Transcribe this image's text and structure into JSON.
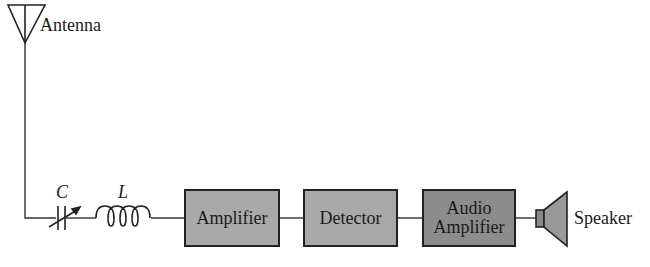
{
  "antenna": {
    "label": "Antenna"
  },
  "tuning": {
    "capacitor_label": "C",
    "inductor_label": "L"
  },
  "blocks": [
    {
      "label": "Amplifier"
    },
    {
      "label": "Detector"
    },
    {
      "label": "Audio\nAmplifier"
    }
  ],
  "speaker": {
    "label": "Speaker"
  },
  "colors": {
    "block_fill": "#a9a9a9",
    "audio_block_fill": "#8c8c8c",
    "line": "#333333"
  }
}
